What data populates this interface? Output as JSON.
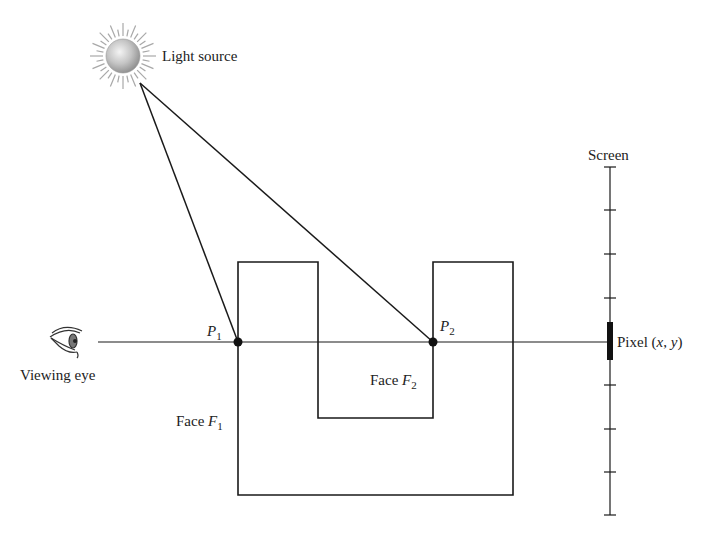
{
  "diagram": {
    "type": "ray-tracing-illustration",
    "labels": {
      "light_source": "Light source",
      "viewing_eye": "Viewing eye",
      "screen": "Screen",
      "pixel_prefix": "Pixel (",
      "pixel_x": "x",
      "pixel_sep": ", ",
      "pixel_y": "y",
      "pixel_suffix": ")",
      "p1_main": "P",
      "p1_sub": "1",
      "p2_main": "P",
      "p2_sub": "2",
      "face1_prefix": "Face ",
      "face1_main": "F",
      "face1_sub": "1",
      "face2_prefix": "Face ",
      "face2_main": "F",
      "face2_sub": "2"
    },
    "colors": {
      "stroke": "#1a1a1a",
      "sun_fill": "#bdbdbd",
      "sun_rays": "#a8a8a8"
    },
    "geometry": {
      "eye_ray_y": 342,
      "p1": [
        238,
        342
      ],
      "p2": [
        433,
        342
      ],
      "light_origin": [
        140,
        83
      ],
      "screen_x": 610,
      "screen_ticks_y": [
        167,
        210,
        254,
        298,
        385,
        429,
        472,
        515
      ],
      "pixel_bar": [
        322,
        360
      ]
    }
  }
}
